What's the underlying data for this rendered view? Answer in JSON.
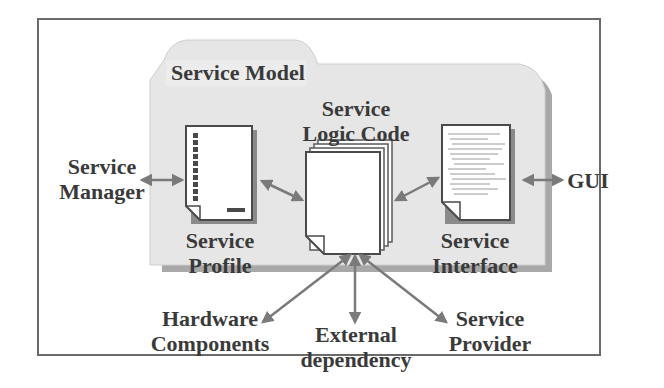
{
  "title": "Service Model",
  "components": {
    "logic_code": {
      "line1": "Service",
      "line2": "Logic Code"
    },
    "profile": {
      "line1": "Service",
      "line2": "Profile"
    },
    "interface": {
      "line1": "Service",
      "line2": "Interface"
    }
  },
  "external": {
    "manager": {
      "line1": "Service",
      "line2": "Manager"
    },
    "gui": {
      "label": "GUI"
    },
    "hardware": {
      "line1": "Hardware",
      "line2": "Components"
    },
    "dependency": {
      "line1": "External",
      "line2": "dependency"
    },
    "provider": {
      "line1": "Service",
      "line2": "Provider"
    }
  },
  "colors": {
    "folder_fill": "#e6e6e6",
    "folder_shadow": "#a8a8a8",
    "arrow": "#7a7a7a",
    "text": "#3a3a3a",
    "border": "#6a6a6a"
  }
}
